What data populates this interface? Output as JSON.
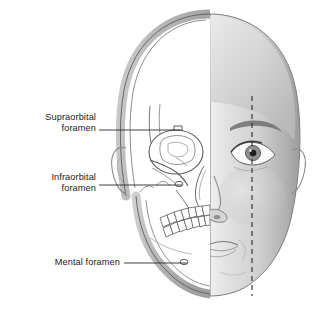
{
  "figure": {
    "kind": "anatomical-illustration",
    "background": "#ffffff"
  },
  "labels": [
    {
      "id": "supraorbital",
      "line1": "Supraorbital",
      "line2": "foramen",
      "leader": {
        "from_x": 99,
        "to_x": 181,
        "y": 130
      },
      "marker": {
        "x": 178,
        "y": 128,
        "shape": "notch"
      }
    },
    {
      "id": "infraorbital",
      "line1": "Infraorbital",
      "line2": "foramen",
      "leader": {
        "from_x": 99,
        "to_x": 182,
        "y": 185
      },
      "marker": {
        "x": 179,
        "y": 184,
        "shape": "oval-foramen"
      }
    },
    {
      "id": "mental",
      "line1": "Mental foramen",
      "line2": "",
      "leader": {
        "from_x": 124,
        "to_x": 187,
        "y": 263
      },
      "marker": {
        "x": 184,
        "y": 262,
        "shape": "oval-foramen"
      }
    }
  ],
  "halves": {
    "left": {
      "name": "skull-half",
      "description": "line-drawn skull: cranium, orbit, zygomatic arch, nasal aperture, maxilla, mandible, teeth, ear outline"
    },
    "right": {
      "name": "face-half",
      "description": "shaded surface anatomy: forehead, eyebrow, eye, nose, lips, chin, ear"
    }
  },
  "midline": {
    "name": "pupil-vertical-reference-line",
    "style": "dashed",
    "x": 252,
    "from_y": 96,
    "to_y": 296
  },
  "colors": {
    "bone_fill": "#b9b9b9",
    "bone_line": "#4a4a4a",
    "detail_line": "#6b6b6b",
    "skin_light": "#e7e7e7",
    "skin_mid": "#c9c9c9",
    "skin_dark": "#9a9a9a",
    "label_text": "#1a1a1a",
    "leader_line": "#2a2a2a"
  }
}
